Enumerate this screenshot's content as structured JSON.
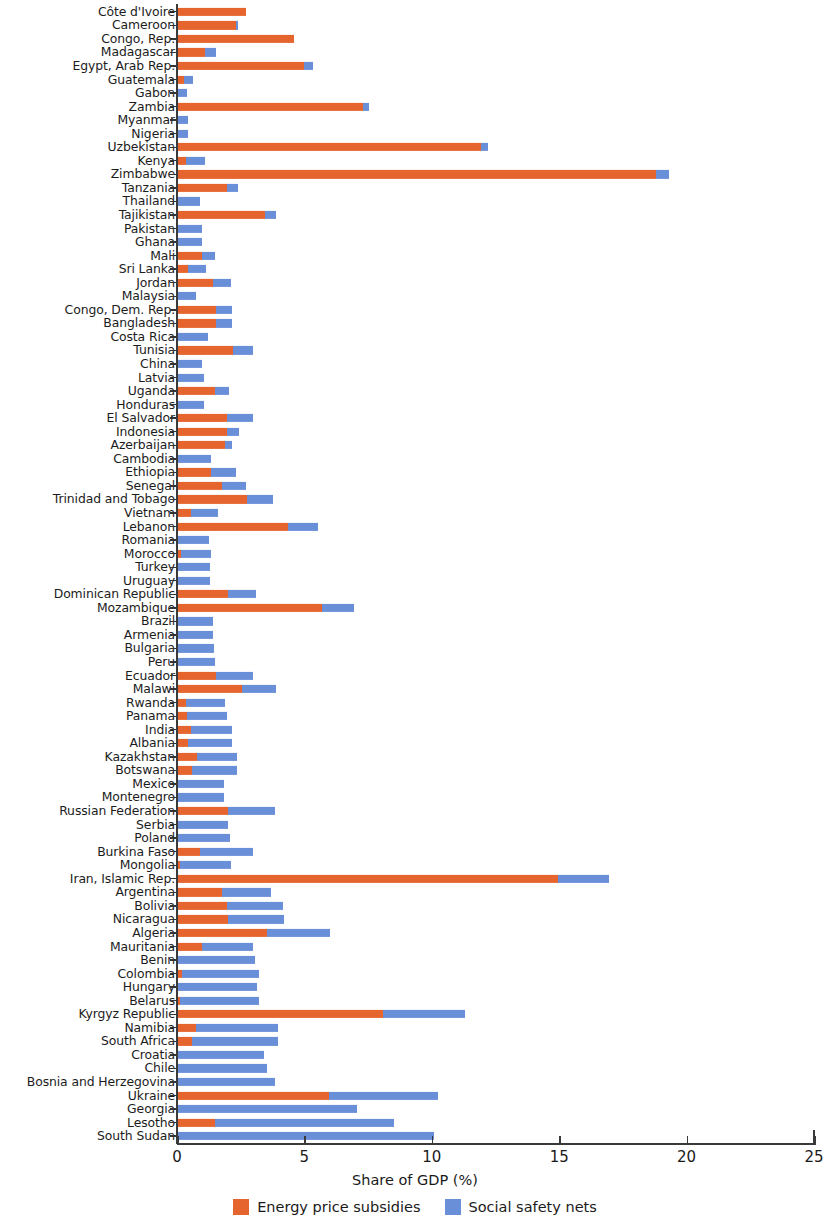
{
  "chart_data": {
    "type": "bar",
    "orientation": "horizontal",
    "stacked": true,
    "title": "",
    "xlabel": "Share of GDP (%)",
    "ylabel": "",
    "xlim": [
      0,
      25
    ],
    "xticks": [
      0,
      5,
      10,
      15,
      20,
      25
    ],
    "xticklabels": [
      "0",
      "5",
      "10",
      "15",
      "20",
      "25"
    ],
    "grid": false,
    "legend_position": "bottom-center",
    "colors": {
      "energy_price_subsidies": "#e6652e",
      "social_safety_nets": "#6a8fd9"
    },
    "series": [
      {
        "name": "Energy price subsidies",
        "color": "#e6652e"
      },
      {
        "name": "Social safety nets",
        "color": "#6a8fd9"
      }
    ],
    "categories": [
      "Côte d'Ivoire",
      "Cameroon",
      "Congo, Rep.",
      "Madagascar",
      "Egypt, Arab Rep.",
      "Guatemala",
      "Gabon",
      "Zambia",
      "Myanmar",
      "Nigeria",
      "Uzbekistan",
      "Kenya",
      "Zimbabwe",
      "Tanzania",
      "Thailand",
      "Tajikistan",
      "Pakistan",
      "Ghana",
      "Mali",
      "Sri Lanka",
      "Jordan",
      "Malaysia",
      "Congo, Dem. Rep.",
      "Bangladesh",
      "Costa Rica",
      "Tunisia",
      "China",
      "Latvia",
      "Uganda",
      "Honduras",
      "El Salvador",
      "Indonesia",
      "Azerbaijan",
      "Cambodia",
      "Ethiopia",
      "Senegal",
      "Trinidad and Tobago",
      "Vietnam",
      "Lebanon",
      "Romania",
      "Morocco",
      "Turkey",
      "Uruguay",
      "Dominican Republic",
      "Mozambique",
      "Brazil",
      "Armenia",
      "Bulgaria",
      "Peru",
      "Ecuador",
      "Malawi",
      "Rwanda",
      "Panama",
      "India",
      "Albania",
      "Kazakhstan",
      "Botswana",
      "Mexico",
      "Montenegro",
      "Russian Federation",
      "Serbia",
      "Poland",
      "Burkina Faso",
      "Mongolia",
      "Iran, Islamic Rep.",
      "Argentina",
      "Bolivia",
      "Nicaragua",
      "Algeria",
      "Mauritania",
      "Benin",
      "Colombia",
      "Hungary",
      "Belarus",
      "Kyrgyz Republic",
      "Namibia",
      "South Africa",
      "Croatia",
      "Chile",
      "Bosnia and Herzegovina",
      "Ukraine",
      "Georgia",
      "Lesotho",
      "South Sudan"
    ],
    "values": {
      "energy_price_subsidies": [
        2.7,
        2.3,
        4.6,
        1.1,
        5.0,
        0.28,
        0.0,
        7.3,
        0.05,
        0.05,
        11.95,
        0.35,
        18.8,
        1.95,
        0.0,
        3.45,
        0.05,
        0.0,
        1.0,
        0.45,
        1.4,
        0.0,
        1.55,
        1.55,
        0.0,
        2.2,
        0.0,
        0.0,
        1.5,
        0.0,
        1.95,
        1.95,
        1.9,
        0.0,
        1.35,
        1.75,
        2.75,
        0.55,
        4.35,
        0.0,
        0.15,
        0.0,
        0.0,
        2.0,
        5.7,
        0.0,
        0.0,
        0.0,
        0.0,
        1.55,
        2.55,
        0.35,
        0.4,
        0.55,
        0.45,
        0.8,
        0.6,
        0.0,
        0.0,
        2.0,
        0.0,
        0.05,
        0.9,
        0.1,
        14.95,
        1.75,
        1.95,
        2.0,
        3.55,
        1.0,
        0.0,
        0.2,
        0.0,
        0.1,
        8.1,
        0.75,
        0.6,
        0.0,
        0.0,
        0.0,
        5.95,
        0.0,
        1.5,
        0.0
      ],
      "social_safety_nets": [
        0.0,
        0.1,
        0.0,
        0.45,
        0.35,
        0.35,
        0.4,
        0.25,
        0.4,
        0.4,
        0.25,
        0.75,
        0.5,
        0.45,
        0.9,
        0.45,
        0.95,
        1.0,
        0.5,
        0.7,
        0.7,
        0.75,
        0.6,
        0.6,
        1.2,
        0.8,
        1.0,
        1.05,
        0.55,
        1.05,
        1.05,
        0.5,
        0.25,
        1.35,
        0.95,
        0.95,
        1.0,
        1.05,
        1.2,
        1.25,
        1.2,
        1.3,
        1.3,
        1.1,
        1.25,
        1.4,
        1.4,
        1.45,
        1.5,
        1.45,
        1.35,
        1.55,
        1.55,
        1.6,
        1.7,
        1.55,
        1.75,
        1.85,
        1.85,
        1.85,
        2.0,
        2.05,
        2.1,
        2.0,
        2.0,
        1.95,
        2.2,
        2.2,
        2.45,
        2.0,
        3.05,
        3.0,
        3.15,
        3.1,
        3.2,
        3.2,
        3.35,
        3.4,
        3.55,
        3.85,
        4.3,
        7.05,
        7.0,
        10.1
      ]
    }
  },
  "legend": {
    "items": [
      {
        "label": "Energy price subsidies",
        "color": "#e6652e"
      },
      {
        "label": "Social safety nets",
        "color": "#6a8fd9"
      }
    ]
  }
}
